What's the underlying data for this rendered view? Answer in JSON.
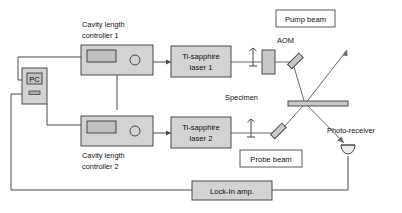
{
  "figure": {
    "background_color": "#ffffff",
    "box_fill_color": "#d3d3d3",
    "box_stroke_color": "#4a4a4a",
    "wire_color": "#4a4a4a"
  },
  "blocks": {
    "pc": {
      "label": "PC"
    },
    "controller1": {
      "label_line1": "Cavity length",
      "label_line2": "controller 1"
    },
    "controller2": {
      "label_line1": "Cavity length",
      "label_line2": "controller 2"
    },
    "laser1": {
      "label_line1": "Ti-sapphire",
      "label_line2": "laser 1"
    },
    "laser2": {
      "label_line1": "Ti-sapphire",
      "label_line2": "laser 2"
    },
    "aom": {
      "label": "AOM"
    },
    "pump_beam": {
      "label": "Pump beam"
    },
    "probe_beam": {
      "label": "Probe beam"
    },
    "specimen": {
      "label": "Specimen"
    },
    "photo_receiver": {
      "label": "Photo-receiver"
    },
    "lock_in": {
      "label": "Lock-In amp."
    }
  },
  "icons": {
    "pc_screen": "monitor-icon",
    "controller_display": "display-panel-icon",
    "controller_knob": "knob-icon",
    "lens1": "lens-icon",
    "lens2": "lens-icon",
    "mirror1": "mirror-icon",
    "mirror2": "mirror-icon",
    "aom_crystal": "aom-crystal-icon",
    "specimen_bar": "specimen-bar-icon",
    "detector": "photodetector-icon"
  }
}
